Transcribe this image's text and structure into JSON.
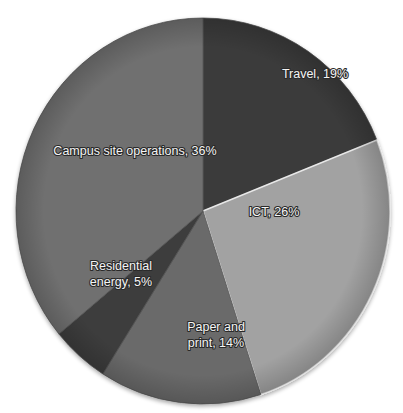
{
  "chart_data": {
    "type": "pie",
    "title": "",
    "start_angle_deg": 0,
    "direction": "clockwise",
    "categories": [
      "Travel",
      "ICT",
      "Paper and print",
      "Residential energy",
      "Campus site operations"
    ],
    "values": [
      19,
      26,
      14,
      5,
      36
    ],
    "unit": "%",
    "labels": [
      "Travel, 19%",
      "ICT, 26%",
      "Paper and\nprint, 14%",
      "Residential\nenergy, 5%",
      "Campus site operations, 36%"
    ],
    "colors": [
      "#3a3a3a",
      "#a2a2a2",
      "#6a6a6a",
      "#3e3e3e",
      "#707070"
    ],
    "legend": "none",
    "data_labels": "inside"
  },
  "labels": {
    "travel": "Travel, 19%",
    "ict": "ICT, 26%",
    "paper_1": "Paper and",
    "paper_2": "print, 14%",
    "residential_1": "Residential",
    "residential_2": "energy, 5%",
    "campus": "Campus site operations, 36%"
  }
}
